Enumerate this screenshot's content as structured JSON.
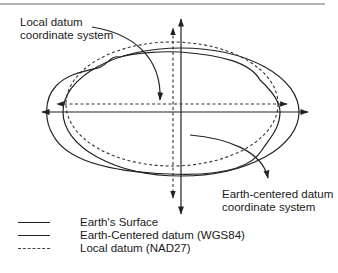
{
  "diagram": {
    "labels": {
      "local_datum_line1": "Local datum",
      "local_datum_line2": "coordinate system",
      "earth_centered_line1": "Earth-centered datum",
      "earth_centered_line2": "coordinate system"
    },
    "legend": [
      {
        "style": "solid",
        "label": "Earth's Surface"
      },
      {
        "style": "solid",
        "label": "Earth-Centered datum (WGS84)"
      },
      {
        "style": "dashed",
        "label": "Local datum (NAD27)"
      }
    ],
    "colors": {
      "line": "#222222",
      "rule": "#9a9a9a",
      "background": "#ffffff"
    }
  }
}
